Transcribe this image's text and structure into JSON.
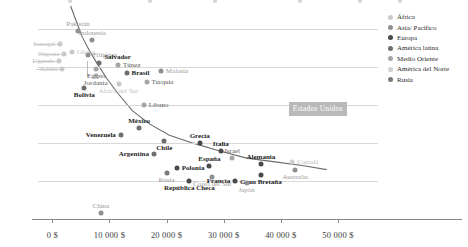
{
  "chart_data": {
    "type": "scatter",
    "title": "",
    "xlabel": "",
    "ylabel": "",
    "xlim": [
      -2500,
      57000
    ],
    "ylim": [
      0,
      112
    ],
    "grid": true,
    "legend_position": "right",
    "x_ticks": [
      0,
      10000,
      20000,
      30000,
      40000,
      50000
    ],
    "x_ticklabels": [
      "0 $",
      "10 000 $",
      "20 000 $",
      "30 000 $",
      "40 000 $",
      "50 000 $"
    ],
    "y_ticks": [
      0,
      20,
      40,
      60,
      80,
      100
    ],
    "y_ticklabels": [
      "0 %",
      "20 %",
      "40 %",
      "60 %",
      "80 %",
      "100 %"
    ],
    "series": [
      {
        "name": "África",
        "color": "#c9c9c9",
        "label_color": "#c2c2c2"
      },
      {
        "name": "Asia/ Pacífico",
        "color": "#8f8f8f",
        "label_color": "#9a9a9a"
      },
      {
        "name": "Europa",
        "color": "#4a4a4a",
        "label_color": "#2b2b2b"
      },
      {
        "name": "América latina",
        "color": "#6e6e6e",
        "label_color": "#2b2b2b"
      },
      {
        "name": "Medio Oriente",
        "color": "#a5a5a5",
        "label_color": "#5a5a5a"
      },
      {
        "name": "América del Norte",
        "color": "#d0d0d0",
        "label_color": "#bdbdbd"
      },
      {
        "name": "Rusia",
        "color": "#7a7a7a",
        "label_color": "#9a9a9a"
      }
    ],
    "points": [
      {
        "label": "Senegal",
        "x": 1400,
        "y": 92,
        "group": "África",
        "lp": "left",
        "leader": true
      },
      {
        "label": "Nigeria",
        "x": 2100,
        "y": 87,
        "group": "África",
        "lp": "left",
        "leader": true
      },
      {
        "label": "Uganda",
        "x": 1200,
        "y": 83,
        "group": "África",
        "lp": "left",
        "leader": true
      },
      {
        "label": "Kenia",
        "x": 1700,
        "y": 79,
        "group": "África",
        "lp": "left",
        "leader": true
      },
      {
        "label": "Ghana",
        "x": 3400,
        "y": 88,
        "group": "África",
        "lp": "right",
        "leader": true
      },
      {
        "label": "Pakistán",
        "x": 4500,
        "y": 99,
        "group": "Asia/ Pacífico",
        "lp": "top"
      },
      {
        "label": "Indonesia",
        "x": 7000,
        "y": 94,
        "group": "Asia/ Pacífico",
        "lp": "top"
      },
      {
        "label": "Filipinas",
        "x": 6200,
        "y": 86,
        "group": "Asia/ Pacífico",
        "lp": "right"
      },
      {
        "label": "Salvador",
        "x": 8200,
        "y": 82,
        "group": "América latina",
        "lp": "topright",
        "bold": true
      },
      {
        "label": "Egipto",
        "x": 7700,
        "y": 79,
        "group": "Medio Oriente",
        "lp": "below"
      },
      {
        "label": "Jordania",
        "x": 7600,
        "y": 75,
        "group": "Medio Oriente",
        "lp": "below"
      },
      {
        "label": "Túnez",
        "x": 11500,
        "y": 81,
        "group": "Medio Oriente",
        "lp": "right"
      },
      {
        "label": "Brasil",
        "x": 13000,
        "y": 77,
        "group": "América latina",
        "lp": "right",
        "bold": true
      },
      {
        "label": "Malasia",
        "x": 19000,
        "y": 78,
        "group": "Asia/ Pacífico",
        "lp": "right"
      },
      {
        "label": "Turquía",
        "x": 16500,
        "y": 72,
        "group": "Medio Oriente",
        "lp": "right"
      },
      {
        "label": "África del Sur",
        "x": 11600,
        "y": 71,
        "group": "África",
        "lp": "below"
      },
      {
        "label": "Bolivia",
        "x": 5600,
        "y": 69,
        "group": "América latina",
        "lp": "below",
        "bold": true
      },
      {
        "label": "Líbano",
        "x": 16000,
        "y": 60,
        "group": "Medio Oriente",
        "lp": "right"
      },
      {
        "label": "México",
        "x": 15200,
        "y": 48,
        "group": "América latina",
        "lp": "top",
        "bold": true
      },
      {
        "label": "Venezuela",
        "x": 12000,
        "y": 44,
        "group": "América latina",
        "lp": "left",
        "bold": true
      },
      {
        "label": "Chile",
        "x": 19600,
        "y": 41,
        "group": "América latina",
        "lp": "below",
        "bold": true
      },
      {
        "label": "Argentina",
        "x": 17800,
        "y": 34,
        "group": "América latina",
        "lp": "left",
        "bold": true
      },
      {
        "label": "Grecia",
        "x": 25800,
        "y": 40,
        "group": "Europa",
        "lp": "top",
        "bold": true
      },
      {
        "label": "Polonia",
        "x": 21800,
        "y": 27,
        "group": "Europa",
        "lp": "right",
        "bold": true
      },
      {
        "label": "España",
        "x": 27500,
        "y": 28,
        "group": "Europa",
        "lp": "top",
        "bold": true
      },
      {
        "label": "Italia",
        "x": 29500,
        "y": 36,
        "group": "Europa",
        "lp": "top",
        "bold": true
      },
      {
        "label": "Israel",
        "x": 31500,
        "y": 32,
        "group": "Medio Oriente",
        "lp": "top"
      },
      {
        "label": "Alemania",
        "x": 36500,
        "y": 29,
        "group": "Europa",
        "lp": "top",
        "bold": true
      },
      {
        "label": "Canadá",
        "x": 42000,
        "y": 30,
        "group": "América del Norte",
        "lp": "right"
      },
      {
        "label": "Australia",
        "x": 42500,
        "y": 26,
        "group": "Asia/ Pacífico",
        "lp": "below"
      },
      {
        "label": "Gran Bretaña",
        "x": 36500,
        "y": 23,
        "group": "Europa",
        "lp": "below",
        "bold": true
      },
      {
        "label": "Francia",
        "x": 32000,
        "y": 20,
        "group": "Europa",
        "lp": "left",
        "bold": true
      },
      {
        "label": "Japón",
        "x": 34000,
        "y": 19,
        "group": "Asia/ Pacífico",
        "lp": "below"
      },
      {
        "label": "Corea del Sur",
        "x": 28000,
        "y": 22,
        "group": "Asia/ Pacífico",
        "lp": "below"
      },
      {
        "label": "República Checa",
        "x": 24000,
        "y": 20,
        "group": "Europa",
        "lp": "below",
        "bold": true
      },
      {
        "label": "Rusia",
        "x": 20000,
        "y": 24,
        "group": "Rusia",
        "lp": "below"
      },
      {
        "label": "China",
        "x": 8500,
        "y": 3,
        "group": "Asia/ Pacífico",
        "lp": "top"
      }
    ],
    "highlight": {
      "label": "Estados Unidos",
      "x": 50500,
      "y": 58,
      "group": "América del Norte"
    },
    "trendline": {
      "visible": true,
      "color": "#6b6b6b",
      "points": [
        [
          3200,
          112
        ],
        [
          4200,
          104
        ],
        [
          5200,
          96
        ],
        [
          6400,
          89
        ],
        [
          7800,
          82
        ],
        [
          9500,
          74
        ],
        [
          11500,
          66
        ],
        [
          14000,
          57
        ],
        [
          17000,
          50
        ],
        [
          20500,
          44
        ],
        [
          24500,
          40
        ],
        [
          29000,
          36
        ],
        [
          34000,
          32
        ],
        [
          39000,
          30
        ],
        [
          44000,
          28
        ],
        [
          48000,
          26
        ]
      ]
    }
  },
  "legend": {
    "items": [
      {
        "label": "África"
      },
      {
        "label": "Asia/ Pacífico"
      },
      {
        "label": "Europa"
      },
      {
        "label": "América latina"
      },
      {
        "label": "Medio Oriente"
      },
      {
        "label": "América del Norte"
      },
      {
        "label": "Rusia"
      }
    ]
  }
}
